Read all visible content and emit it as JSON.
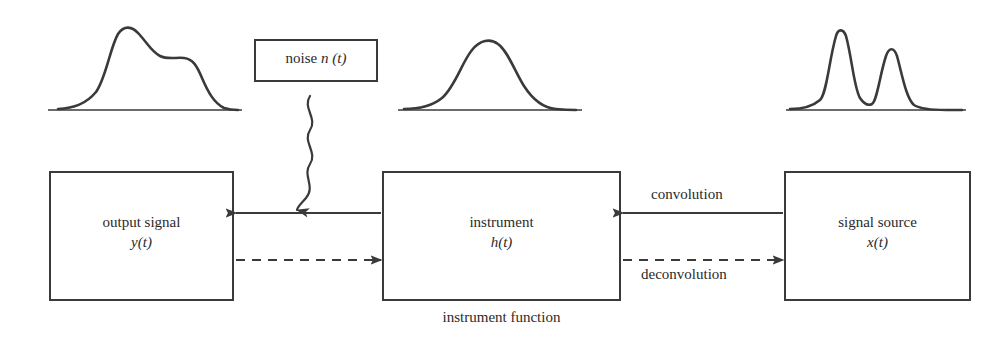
{
  "diagram": {
    "ink_color": "#3a3a3a",
    "text_color": "#2a2a2a",
    "background_color": "#ffffff"
  },
  "boxes": {
    "output": {
      "line1": "output signal",
      "line2": "y(t)"
    },
    "instrument": {
      "line1": "instrument",
      "line2": "h(t)",
      "caption": "instrument function"
    },
    "source": {
      "line1": "signal source",
      "line2": "x(t)"
    },
    "noise": {
      "text_plain": "noise",
      "text_italic": "n (t)"
    }
  },
  "edges": {
    "convolution_label": "convolution",
    "deconvolution_label": "deconvolution"
  },
  "waveforms": {
    "left": {
      "name": "output-signal-waveform",
      "description": "broad blurred profile with a tall left peak and lower right shoulder"
    },
    "middle": {
      "name": "instrument-function-waveform",
      "description": "single broad gaussian instrument response"
    },
    "right": {
      "name": "source-signal-waveform",
      "description": "two sharply resolved peaks, left peak taller"
    }
  },
  "icons": {
    "noise_arrow": "wavy-arrow-icon",
    "solid_arrow": "arrow-left-icon",
    "dashed_arrow": "arrow-right-dashed-icon"
  }
}
